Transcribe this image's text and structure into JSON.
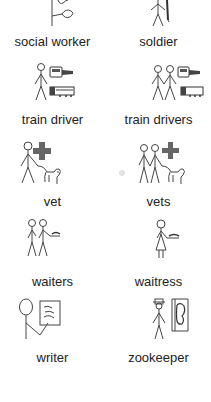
{
  "symbols": [
    {
      "label": "social worker",
      "icon": "social-worker-icon"
    },
    {
      "label": "soldier",
      "icon": "soldier-icon"
    },
    {
      "label": "train driver",
      "icon": "train-driver-icon"
    },
    {
      "label": "train drivers",
      "icon": "train-drivers-icon"
    },
    {
      "label": "vet",
      "icon": "vet-icon"
    },
    {
      "label": "vets",
      "icon": "vets-icon"
    },
    {
      "label": "waiters",
      "icon": "waiters-icon"
    },
    {
      "label": "waitress",
      "icon": "waitress-icon"
    },
    {
      "label": "writer",
      "icon": "writer-icon"
    },
    {
      "label": "zookeeper",
      "icon": "zookeeper-icon"
    }
  ],
  "colors": {
    "text": "#222222",
    "cross": "#666666",
    "line": "#444444"
  }
}
